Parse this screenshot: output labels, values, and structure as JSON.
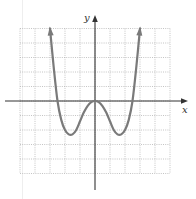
{
  "chart_data": {
    "type": "line",
    "title": "",
    "xlabel": "x",
    "ylabel": "y",
    "xlim": [
      -5,
      5
    ],
    "ylim": [
      -5,
      5
    ],
    "grid": true,
    "grid_style": "dotted",
    "tick_labels": false,
    "series": [
      {
        "name": "f(x)",
        "x": [
          -3.0,
          -2.75,
          -2.5,
          -2.25,
          -2.0,
          -1.75,
          -1.5,
          -1.25,
          -1.0,
          -0.75,
          -0.5,
          -0.25,
          0,
          0.25,
          0.5,
          0.75,
          1.0,
          1.25,
          1.5,
          1.75,
          2.0,
          2.25,
          2.5,
          2.75,
          3.0
        ],
        "y": [
          5.0,
          2.3,
          0.0,
          -1.3,
          -2.0,
          -2.3,
          -2.3,
          -2.0,
          -1.4,
          -0.8,
          -0.35,
          -0.08,
          0,
          -0.08,
          -0.35,
          -0.8,
          -1.4,
          -2.0,
          -2.3,
          -2.3,
          -2.0,
          -1.3,
          0.0,
          2.3,
          5.0
        ]
      }
    ],
    "key_points": {
      "local_max": [
        0,
        0
      ],
      "local_min": [
        [
          -1.6,
          -2.3
        ],
        [
          1.6,
          -2.3
        ]
      ],
      "x_intercepts": [
        -2.5,
        0,
        2.5
      ],
      "end_behavior": "both ends increase to +infinity"
    }
  },
  "labels": {
    "x_axis": "x",
    "y_axis": "y"
  },
  "colors": {
    "curve": "#7a7a7a",
    "axes": "#333333",
    "grid": "#b5b5b5"
  }
}
